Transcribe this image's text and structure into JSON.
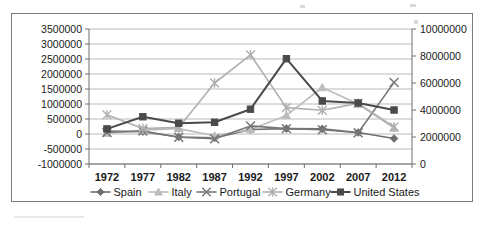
{
  "chart_data": {
    "type": "line",
    "title": "",
    "subtitle": "",
    "xlabel": "",
    "ylabel": "",
    "categories": [
      "1972",
      "1977",
      "1982",
      "1987",
      "1992",
      "1997",
      "2002",
      "2007",
      "2012"
    ],
    "primary_axis": {
      "position": "left",
      "ylim": [
        -1000000,
        3500000
      ],
      "tick_step": 500000,
      "ticks": [
        "3500000",
        "3000000",
        "2500000",
        "2000000",
        "1500000",
        "1000000",
        "500000",
        "0",
        "-500000",
        "-1000000"
      ],
      "tick_values": [
        3500000,
        3000000,
        2500000,
        2000000,
        1500000,
        1000000,
        500000,
        0,
        -500000,
        -1000000
      ]
    },
    "secondary_axis": {
      "position": "right",
      "ylim": [
        0,
        10000000
      ],
      "tick_step": 2000000,
      "ticks": [
        "10000000",
        "8000000",
        "6000000",
        "4000000",
        "2000000",
        "0"
      ],
      "tick_values": [
        10000000,
        8000000,
        6000000,
        4000000,
        2000000,
        0
      ]
    },
    "grid": true,
    "legend_position": "bottom",
    "series": [
      {
        "name": "Spain",
        "axis": "primary",
        "color": "#6e6e6e",
        "marker": "diamond",
        "values": [
          100000,
          80000,
          -100000,
          -130000,
          150000,
          180000,
          170000,
          50000,
          -150000
        ]
      },
      {
        "name": "Italy",
        "axis": "primary",
        "color": "#bdbdbd",
        "marker": "triangle",
        "values": [
          30000,
          130000,
          180000,
          -60000,
          150000,
          620000,
          1550000,
          1000000,
          200000
        ]
      },
      {
        "name": "Portugal",
        "axis": "primary",
        "color": "#787878",
        "marker": "x-star",
        "values": [
          50000,
          100000,
          -110000,
          -160000,
          270000,
          180000,
          140000,
          40000,
          1720000
        ]
      },
      {
        "name": "Germany",
        "axis": "primary",
        "color": "#b0b0b0",
        "marker": "asterisk",
        "values": [
          640000,
          180000,
          220000,
          1700000,
          2640000,
          880000,
          790000,
          1020000,
          240000
        ]
      },
      {
        "name": "United States",
        "axis": "secondary",
        "color": "#4a4a4a",
        "marker": "square",
        "values": [
          2600000,
          3500000,
          3020000,
          3090000,
          4060000,
          7800000,
          4670000,
          4520000,
          4000000
        ]
      }
    ],
    "legend": [
      {
        "label": "Spain",
        "marker": "diamond",
        "color": "#6e6e6e"
      },
      {
        "label": "Italy",
        "marker": "triangle",
        "color": "#bdbdbd"
      },
      {
        "label": "Portugal",
        "marker": "x-star",
        "color": "#787878"
      },
      {
        "label": "Germany",
        "marker": "asterisk",
        "color": "#b0b0b0"
      },
      {
        "label": "United States",
        "marker": "square",
        "color": "#4a4a4a"
      }
    ]
  },
  "colors": {
    "frame_border": "#7b7b7b",
    "gridline": "#a8a8a8",
    "axis": "#6e6e6e",
    "text": "#1a1a1a",
    "background": "#ffffff"
  }
}
